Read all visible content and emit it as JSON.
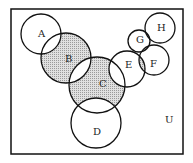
{
  "diagram": {
    "type": "venn",
    "universe_label": "U",
    "shade_color": "#c8c8c8",
    "stroke_color": "#111111",
    "sets": [
      {
        "label": "A",
        "cx": 41,
        "cy": 34,
        "r": 20
      },
      {
        "label": "B",
        "cx": 66,
        "cy": 58,
        "r": 25
      },
      {
        "label": "C",
        "cx": 97,
        "cy": 85,
        "r": 28
      },
      {
        "label": "D",
        "cx": 96,
        "cy": 123,
        "r": 25
      },
      {
        "label": "E",
        "cx": 127,
        "cy": 69,
        "r": 18
      },
      {
        "label": "F",
        "cx": 154,
        "cy": 60,
        "r": 15
      },
      {
        "label": "G",
        "cx": 139,
        "cy": 41,
        "r": 11
      },
      {
        "label": "H",
        "cx": 160,
        "cy": 28,
        "r": 15
      }
    ],
    "shaded_regions": [
      "B minus (A ∪ C)",
      "C minus (B ∪ D ∪ E)",
      "(E ∩ G) minus F",
      "(E ∩ F) minus G",
      "(F ∩ G) ∪ (F ∩ H)"
    ]
  }
}
